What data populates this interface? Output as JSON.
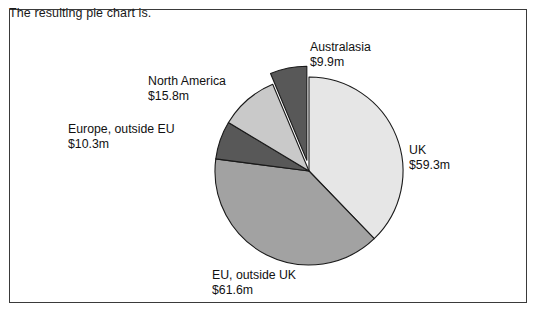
{
  "caption": "The resulting pie chart is.",
  "chart_data": {
    "type": "pie",
    "title": "",
    "unit": "$m",
    "total": 156.9,
    "legend_position": "callout-labels",
    "grid": false,
    "categories": [
      "UK",
      "EU, outside UK",
      "Europe, outside EU",
      "North America",
      "Australasia"
    ],
    "values": [
      59.3,
      61.6,
      10.3,
      15.8,
      9.9
    ],
    "value_labels": [
      "$59.3m",
      "$61.6m",
      "$10.3m",
      "$15.8m",
      "$9.9m"
    ],
    "colors": [
      "#e6e6e6",
      "#a2a2a2",
      "#585858",
      "#c9c9c9",
      "#585858"
    ],
    "exploded": [
      "Australasia"
    ],
    "start_angle_deg": 0,
    "direction": "clockwise",
    "slices": [
      {
        "name": "UK",
        "value": 59.3,
        "label": "UK",
        "value_label": "$59.3m",
        "percent": 37.8,
        "angle_deg": 136.1,
        "color": "#e6e6e6",
        "exploded": false
      },
      {
        "name": "EU, outside UK",
        "value": 61.6,
        "label": "EU, outside UK",
        "value_label": "$61.6m",
        "percent": 39.3,
        "angle_deg": 141.3,
        "color": "#a2a2a2",
        "exploded": false
      },
      {
        "name": "Europe, outside EU",
        "value": 10.3,
        "label": "Europe, outside EU",
        "value_label": "$10.3m",
        "percent": 6.6,
        "angle_deg": 23.6,
        "color": "#585858",
        "exploded": false
      },
      {
        "name": "North America",
        "value": 15.8,
        "label": "North America",
        "value_label": "$15.8m",
        "percent": 10.1,
        "angle_deg": 36.3,
        "color": "#c9c9c9",
        "exploded": false
      },
      {
        "name": "Australasia",
        "value": 9.9,
        "label": "Australasia",
        "value_label": "$9.9m",
        "percent": 6.3,
        "angle_deg": 22.7,
        "color": "#585858",
        "exploded": true
      }
    ],
    "stroke_color": "#1a1a1a",
    "geometry": {
      "cx": 309,
      "cy": 171,
      "r": 94
    }
  },
  "labels": {
    "uk": {
      "name": "UK",
      "value": "$59.3m"
    },
    "eu_outside_uk": {
      "name": "EU, outside UK",
      "value": "$61.6m"
    },
    "europe_outside_eu": {
      "name": "Europe, outside EU",
      "value": "$10.3m"
    },
    "north_america": {
      "name": "North America",
      "value": "$15.8m"
    },
    "australasia": {
      "name": "Australasia",
      "value": "$9.9m"
    }
  }
}
